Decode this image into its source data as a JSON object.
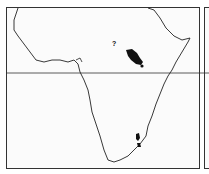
{
  "map": {
    "subject": "Africa distribution map",
    "equator_line": true,
    "colors": {
      "outline": "#222222",
      "range_fill": "#111111",
      "frame": "#333333"
    },
    "markers": [
      {
        "label": "?",
        "x": 113,
        "y": 44
      }
    ],
    "ranges": [
      {
        "name": "east-africa-range"
      },
      {
        "name": "southeast-africa-range"
      }
    ]
  }
}
